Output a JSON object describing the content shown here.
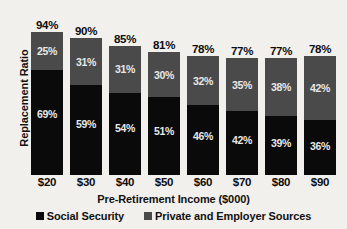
{
  "chart_data": {
    "type": "bar",
    "subtype": "stacked-column",
    "title": "",
    "xlabel": "Pre-Retirement Income ($000)",
    "ylabel": "Replacement Ratio",
    "categories": [
      "$20",
      "$30",
      "$40",
      "$50",
      "$60",
      "$70",
      "$80",
      "$90"
    ],
    "series": [
      {
        "name": "Social Security",
        "color": "#0a0a0a",
        "values": [
          69,
          59,
          54,
          51,
          46,
          42,
          39,
          36
        ],
        "value_labels": [
          "69%",
          "59%",
          "54%",
          "51%",
          "46%",
          "42%",
          "39%",
          "36%"
        ]
      },
      {
        "name": "Private and Employer Sources",
        "color": "#4a4a4a",
        "values": [
          25,
          31,
          31,
          30,
          32,
          35,
          38,
          42
        ],
        "value_labels": [
          "25%",
          "31%",
          "31%",
          "30%",
          "32%",
          "35%",
          "38%",
          "42%"
        ]
      }
    ],
    "totals": [
      94,
      90,
      85,
      81,
      78,
      77,
      77,
      78
    ],
    "total_labels": [
      "94%",
      "90%",
      "85%",
      "81%",
      "78%",
      "77%",
      "77%",
      "78%"
    ],
    "ylim": [
      0,
      100
    ],
    "grid": false,
    "legend_position": "bottom",
    "background_color": "#f2f0ed"
  },
  "legend": {
    "entries": [
      {
        "label": "Social Security"
      },
      {
        "label": "Private and Employer Sources"
      }
    ]
  }
}
